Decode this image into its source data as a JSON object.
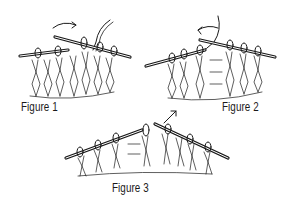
{
  "figures": [
    {
      "id": 1,
      "label": "Figure 1",
      "arrow": "right-curved",
      "description": "Right needle inserted from left through stitch, yarn over right needle"
    },
    {
      "id": 2,
      "label": "Figure 2",
      "arrow": "left-curved",
      "description": "Yarn wrapped around right needle, pull through"
    },
    {
      "id": 3,
      "label": "Figure 3",
      "arrow": "up-right",
      "description": "New stitch lifted off left needle"
    }
  ],
  "colors": {
    "ink": "#1a1a1a",
    "background": "#ffffff"
  }
}
